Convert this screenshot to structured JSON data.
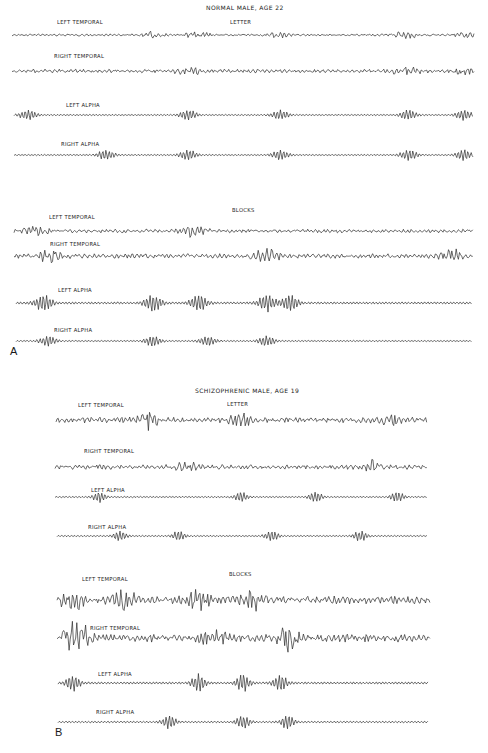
{
  "chart_data": {
    "type": "line",
    "panels": [
      {
        "id": "A",
        "title": "NORMAL MALE, AGE 22",
        "conditions": [
          {
            "name": "LETTER",
            "channels": [
              {
                "label": "LEFT TEMPORAL",
                "kind": "temporal",
                "amplitude": "low",
                "bursts": [
                  0.3,
                  0.4,
                  0.58,
                  0.85,
                  0.98
                ]
              },
              {
                "label": "RIGHT TEMPORAL",
                "kind": "temporal",
                "amplitude": "medium",
                "bursts": [
                  0.38,
                  0.85,
                  0.98
                ]
              },
              {
                "label": "LEFT ALPHA",
                "kind": "alpha",
                "amplitude": "low",
                "bursts": [
                  0.03,
                  0.38,
                  0.58,
                  0.86,
                  0.98
                ]
              },
              {
                "label": "RIGHT ALPHA",
                "kind": "alpha",
                "amplitude": "low",
                "bursts": [
                  0.2,
                  0.38,
                  0.58,
                  0.86,
                  0.98
                ]
              }
            ]
          },
          {
            "name": "BLOCKS",
            "channels": [
              {
                "label": "LEFT TEMPORAL",
                "kind": "temporal",
                "amplitude": "medium",
                "bursts": [
                  0.05,
                  0.39
                ]
              },
              {
                "label": "RIGHT TEMPORAL",
                "kind": "temporal",
                "amplitude": "medium-high",
                "bursts": [
                  0.08,
                  0.55,
                  0.95
                ]
              },
              {
                "label": "LEFT ALPHA",
                "kind": "alpha",
                "amplitude": "medium",
                "bursts": [
                  0.06,
                  0.3,
                  0.4,
                  0.55,
                  0.6
                ]
              },
              {
                "label": "RIGHT ALPHA",
                "kind": "alpha",
                "amplitude": "low",
                "bursts": [
                  0.07,
                  0.3,
                  0.42,
                  0.55
                ]
              }
            ]
          }
        ]
      },
      {
        "id": "B",
        "title": "SCHIZOPHRENIC MALE, AGE 19",
        "conditions": [
          {
            "name": "LETTER",
            "channels": [
              {
                "label": "LEFT TEMPORAL",
                "kind": "temporal",
                "amplitude": "high",
                "bursts": [
                  0.25,
                  0.5,
                  0.9
                ]
              },
              {
                "label": "RIGHT TEMPORAL",
                "kind": "temporal",
                "amplitude": "medium-high",
                "bursts": [
                  0.35,
                  0.85
                ]
              },
              {
                "label": "LEFT ALPHA",
                "kind": "alpha",
                "amplitude": "low",
                "bursts": [
                  0.12,
                  0.5,
                  0.7,
                  0.92
                ]
              },
              {
                "label": "RIGHT ALPHA",
                "kind": "alpha",
                "amplitude": "low",
                "bursts": [
                  0.17,
                  0.33,
                  0.58,
                  0.82
                ]
              }
            ]
          },
          {
            "name": "BLOCKS",
            "channels": [
              {
                "label": "LEFT TEMPORAL",
                "kind": "temporal",
                "amplitude": "very-high",
                "bursts": [
                  0.04,
                  0.18,
                  0.38,
                  0.52
                ]
              },
              {
                "label": "RIGHT TEMPORAL",
                "kind": "temporal",
                "amplitude": "very-high",
                "bursts": [
                  0.04,
                  0.07,
                  0.42,
                  0.62
                ]
              },
              {
                "label": "LEFT ALPHA",
                "kind": "alpha",
                "amplitude": "medium",
                "bursts": [
                  0.04,
                  0.38,
                  0.5,
                  0.6
                ]
              },
              {
                "label": "RIGHT ALPHA",
                "kind": "alpha",
                "amplitude": "low-medium",
                "bursts": [
                  0.3,
                  0.5,
                  0.62
                ]
              }
            ]
          }
        ]
      }
    ],
    "xlabel": "",
    "ylabel": "",
    "grid": false,
    "legend": "none"
  },
  "labels": {
    "panel_a_title": "NORMAL MALE, AGE 22",
    "panel_b_title": "SCHIZOPHRENIC MALE, AGE 19",
    "letter": "LETTER",
    "blocks": "BLOCKS",
    "left_temporal": "LEFT TEMPORAL",
    "right_temporal": "RIGHT TEMPORAL",
    "left_alpha": "LEFT ALPHA",
    "right_alpha": "RIGHT ALPHA",
    "panel_a_letter": "A",
    "panel_b_letter": "B"
  }
}
